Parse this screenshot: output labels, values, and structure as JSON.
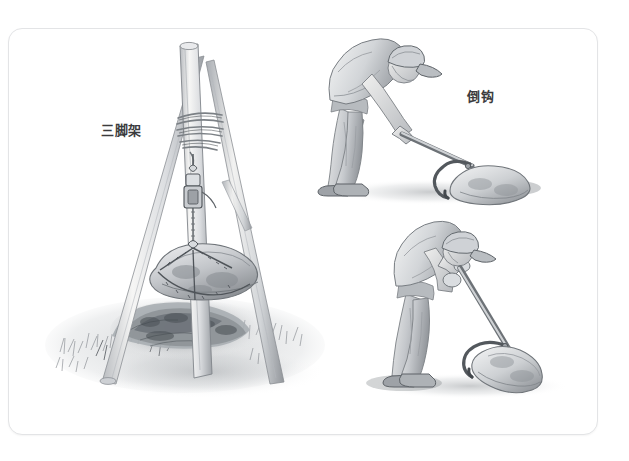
{
  "page": {
    "kind": "scanned-book-page",
    "background_color": "#ffffff",
    "sheet_color": "#ffffff",
    "sheet_border_color": "#e3e4e6",
    "medium": "graphite pencil illustration",
    "width": 629,
    "height": 461
  },
  "captions": {
    "tripod": "三脚架",
    "hook": "倒钩",
    "text_color": "#3b3b3d"
  },
  "illustrations": [
    {
      "id": "tripod-hoist",
      "name": "tripod-hoist-illustration",
      "caption": "三脚架",
      "description": "Three lashed wooden poles forming a tripod over an excavated pit, a chain hoist suspending a large boulder above the hole, grass tufts at the base.",
      "elements": [
        "wooden-pole-left",
        "wooden-pole-center",
        "wooden-pole-right",
        "rope-lashing",
        "chain-hoist",
        "suspended-boulder",
        "excavation-pit",
        "grass-ground"
      ]
    },
    {
      "id": "hook-figure-upper",
      "name": "worker-dragging-stone-illustration",
      "caption": "倒钩",
      "description": "A man wearing a baseball cap, bent forward, pulling a long-handled barbed hook tool engaged on a boulder lying on the ground.",
      "elements": [
        "worker",
        "cap",
        "t-shirt",
        "trousers",
        "boots",
        "hook-tool-handle",
        "hook-head",
        "boulder",
        "ground-shadow"
      ]
    },
    {
      "id": "hook-figure-lower",
      "name": "worker-levering-stone-illustration",
      "caption": "",
      "description": "The same worker seen from another angle, leaning his weight onto the upright barbed hook tool which is hooked under a boulder.",
      "elements": [
        "worker",
        "cap",
        "t-shirt",
        "trousers",
        "boots",
        "hook-tool-handle",
        "hook-head",
        "boulder",
        "ground-shadow"
      ]
    }
  ],
  "palette": {
    "graphite_dark": "#3f4246",
    "graphite_mid": "#8a8d92",
    "graphite_light": "#c6c9cd",
    "graphite_faint": "#e6e8ea",
    "wood_light": "#f2f2f0",
    "wood_shade": "#b9bcc0",
    "shadow": "#9aa0a6"
  }
}
